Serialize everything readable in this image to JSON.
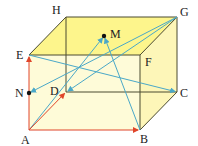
{
  "colors": {
    "top_face": "#fdf58c",
    "side_face": "#fdf6b8",
    "front_face": "#fefbd8",
    "edge": "#4a4a30",
    "red_vector": "#e0452a",
    "blue_vector": "#4aa8c8",
    "point": "#111111"
  },
  "vertices": {
    "A": {
      "label": "A",
      "x": 29,
      "y": 130
    },
    "B": {
      "label": "B",
      "x": 140,
      "y": 130
    },
    "C": {
      "label": "C",
      "x": 177,
      "y": 92
    },
    "D": {
      "label": "D",
      "x": 66,
      "y": 92
    },
    "E": {
      "label": "E",
      "x": 29,
      "y": 55
    },
    "F": {
      "label": "F",
      "x": 140,
      "y": 55
    },
    "G": {
      "label": "G",
      "x": 177,
      "y": 17
    },
    "H": {
      "label": "H",
      "x": 66,
      "y": 17
    }
  },
  "points": {
    "M": {
      "label": "M",
      "x": 104,
      "y": 36
    },
    "N": {
      "label": "N",
      "x": 29,
      "y": 93
    }
  },
  "red_vectors": [
    {
      "from": "A",
      "to": "E"
    },
    {
      "from": "A",
      "to": "B"
    },
    {
      "from": "A",
      "to": "D"
    }
  ],
  "blue_vectors": [
    {
      "from": "E",
      "to": "C"
    },
    {
      "from": "G",
      "to": "N"
    },
    {
      "from": "G",
      "to": "D"
    },
    {
      "from": "A",
      "to": "M"
    },
    {
      "from": "B",
      "to": "M"
    }
  ]
}
